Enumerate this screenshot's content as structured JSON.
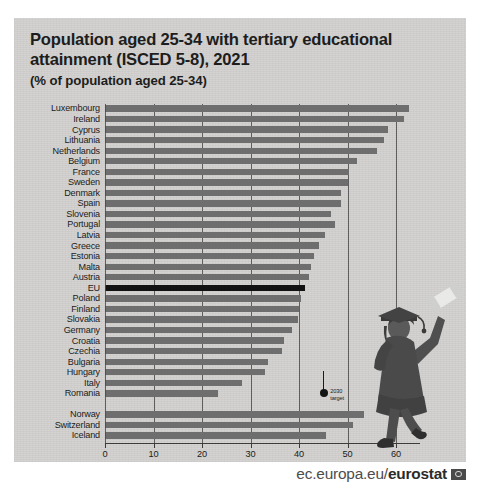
{
  "title": {
    "line1": "Population aged 25-34 with tertiary educational",
    "line2": "attainment (ISCED 5-8), 2021",
    "subtitle": "(% of population aged 25-34)"
  },
  "footer": {
    "url_prefix": "ec.europa.eu/",
    "url_brand": "eurostat",
    "flag_icon": "eu-flag-icon"
  },
  "annotation": {
    "label": "2030\ntarget",
    "value": 45
  },
  "colors": {
    "card_background": "#d3d2d0",
    "bar": "#6e6e6e",
    "bar_highlight": "#121212",
    "text": "#1b1b1b",
    "gridline": "#4a4a4a"
  },
  "chart_data": {
    "type": "bar",
    "orientation": "horizontal",
    "title": "Population aged 25-34 with tertiary educational attainment (ISCED 5-8), 2021",
    "xlabel": "",
    "ylabel": "",
    "unit": "% of population aged 25-34",
    "xlim": [
      0,
      65
    ],
    "xticks": [
      0,
      10,
      20,
      30,
      40,
      50,
      60
    ],
    "grid": true,
    "legend": null,
    "highlight_category": "EU",
    "categories": [
      "Luxembourg",
      "Ireland",
      "Cyprus",
      "Lithuania",
      "Netherlands",
      "Belgium",
      "France",
      "Sweden",
      "Denmark",
      "Spain",
      "Slovenia",
      "Portugal",
      "Latvia",
      "Greece",
      "Estonia",
      "Malta",
      "Austria",
      "EU",
      "Poland",
      "Finland",
      "Slovakia",
      "Germany",
      "Croatia",
      "Czechia",
      "Bulgaria",
      "Hungary",
      "Italy",
      "Romania",
      "",
      "Norway",
      "Switzerland",
      "Iceland"
    ],
    "values": [
      62.6,
      61.7,
      58.3,
      57.5,
      56.0,
      52.0,
      50.3,
      50.2,
      48.6,
      48.7,
      46.5,
      47.5,
      45.3,
      44.2,
      43.1,
      42.5,
      42.0,
      41.2,
      40.5,
      40.1,
      39.8,
      38.5,
      37.0,
      36.4,
      33.6,
      32.9,
      28.3,
      23.3,
      0,
      53.4,
      51.2,
      45.5
    ],
    "efta_group_start_index": 29,
    "annotations": [
      {
        "text": "2030 target",
        "value": 45
      }
    ]
  }
}
